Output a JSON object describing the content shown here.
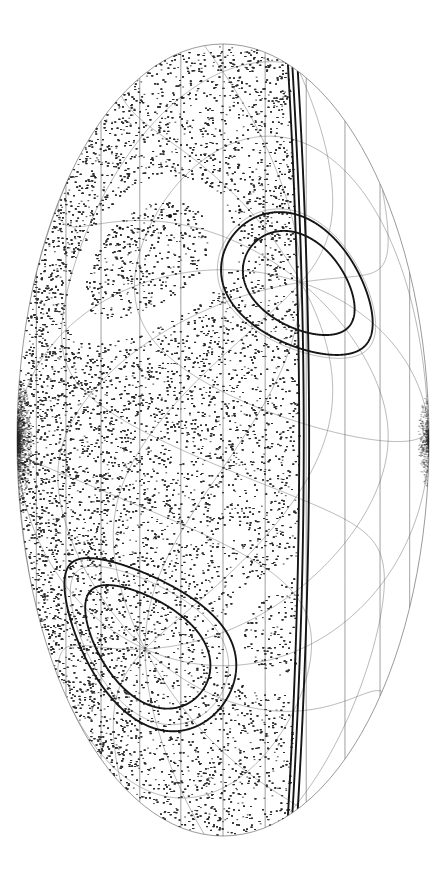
{
  "figure": {
    "kind": "all-sky-survey-map",
    "title": "",
    "caption": "",
    "background_color": "#ffffff",
    "width": 447,
    "height": 884,
    "projection": "oval-equal-area (Mollweide / Aitoff style), portrait orientation with poles at left and right"
  },
  "canvas": {
    "oval": {
      "center_x": 223,
      "center_y": 440,
      "semi_axis_x": 206,
      "semi_axis_y": 396,
      "outline_color": "#555555",
      "outline_width": 0.6
    }
  },
  "graticule": {
    "primary": {
      "name": "native-graticule",
      "meridian_step_deg": 30,
      "parallel_step_deg": 15,
      "line_color": "#4a4a4a",
      "line_width": 0.55,
      "pole_left_label": "",
      "pole_right_label": ""
    },
    "secondary": {
      "name": "rotated-graticule",
      "meridian_step_deg": 30,
      "parallel_step_deg": 30,
      "rotation_deg": 62,
      "line_color": "#5a5a5a",
      "line_width": 0.5
    }
  },
  "scatter": {
    "name": "point-source-catalog",
    "point_color": "#2b2b2b",
    "point_radius_px": 0.48,
    "count": 52000,
    "density_description": "near-uniform coverage with a strong concentration toward the left pole and moderate thinning toward the lower-right",
    "density_peak": "left pole",
    "density_secondary_peak": "right pole"
  },
  "masked_bands": [
    {
      "name": "upper-exclusion-band",
      "description": "thick dark bounding curves enclosing an empty (unsurveyed) band crossing the upper third of the oval",
      "boundary_color": "#151515",
      "boundary_width": 1.9,
      "fill": "#ffffff"
    },
    {
      "name": "lower-exclusion-band",
      "description": "thick dark bounding curves enclosing an empty (unsurveyed) band crossing the lower third of the oval",
      "boundary_color": "#151515",
      "boundary_width": 1.9,
      "fill": "#ffffff"
    },
    {
      "name": "right-exclusion-wedge",
      "description": "large empty wedge on the right of the oval, bounded by thick meridian-like arcs; graticule lines remain visible",
      "boundary_color": "#151515",
      "boundary_width": 1.9,
      "fill": "#ffffff"
    }
  ],
  "markers": [
    {
      "name": "bright-point-a",
      "x": 170,
      "y": 216,
      "radius": 2.1,
      "color": "#101010"
    },
    {
      "name": "bright-point-b",
      "x": 240,
      "y": 210,
      "radius": 1.6,
      "color": "#101010"
    },
    {
      "name": "bright-point-c",
      "x": 280,
      "y": 206,
      "radius": 1.3,
      "color": "#101010"
    },
    {
      "name": "bright-point-d",
      "x": 100,
      "y": 640,
      "radius": 1.6,
      "color": "#101010"
    },
    {
      "name": "bright-point-e",
      "x": 150,
      "y": 500,
      "radius": 1.4,
      "color": "#101010"
    },
    {
      "name": "bright-point-f",
      "x": 120,
      "y": 228,
      "radius": 1.5,
      "color": "#101010"
    }
  ],
  "chart_data": {
    "type": "scatter",
    "title": "",
    "xlabel": "",
    "ylabel": "",
    "projection": "oval equal-area all-sky",
    "grid": true,
    "legend": "none",
    "series": [
      {
        "name": "point-source-catalog",
        "description": "stochastic all-sky point distribution rendered as ~52,000 dots",
        "point_count": 52000
      }
    ],
    "masked_regions": [
      "upper-exclusion-band",
      "lower-exclusion-band",
      "right-exclusion-wedge"
    ],
    "graticule_meridian_step_deg": 30,
    "graticule_parallel_step_deg": 15
  }
}
